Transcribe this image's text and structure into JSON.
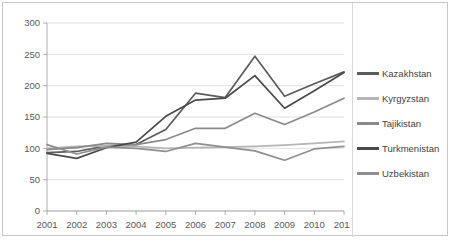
{
  "chart_data": {
    "type": "line",
    "title": "",
    "xlabel": "",
    "ylabel": "",
    "categories": [
      "2001",
      "2002",
      "2003",
      "2004",
      "2005",
      "2006",
      "2007",
      "2008",
      "2009",
      "2010",
      "2011"
    ],
    "ylim": [
      0,
      300
    ],
    "yticks": [
      0,
      50,
      100,
      150,
      200,
      250,
      300
    ],
    "grid": true,
    "legend_position": "right",
    "series": [
      {
        "name": "Kazakhstan",
        "color": "#5c5c5c",
        "values": [
          93,
          95,
          104,
          106,
          130,
          188,
          181,
          247,
          183,
          203,
          222
        ]
      },
      {
        "name": "Kyrgyzstan",
        "color": "#b5b5b5",
        "values": [
          100,
          103,
          104,
          103,
          100,
          101,
          102,
          103,
          105,
          108,
          111
        ]
      },
      {
        "name": "Tajikistan",
        "color": "#8a8a8a",
        "values": [
          98,
          101,
          108,
          106,
          114,
          132,
          132,
          156,
          138,
          158,
          180
        ]
      },
      {
        "name": "Turkmenistan",
        "color": "#4a4a4a",
        "values": [
          92,
          84,
          101,
          110,
          151,
          177,
          180,
          216,
          164,
          192,
          221
        ]
      },
      {
        "name": "Uzbekistan",
        "color": "#8f8f8f",
        "values": [
          106,
          91,
          102,
          100,
          95,
          108,
          102,
          96,
          81,
          99,
          103
        ]
      }
    ]
  },
  "yticks_text": [
    "300",
    "250",
    "200",
    "150",
    "100",
    "50",
    "0"
  ],
  "legend": {
    "items": [
      {
        "label": "Kazakhstan"
      },
      {
        "label": "Kyrgyzstan"
      },
      {
        "label": "Tajikistan"
      },
      {
        "label": "Turkmenistan"
      },
      {
        "label": "Uzbekistan"
      }
    ]
  }
}
